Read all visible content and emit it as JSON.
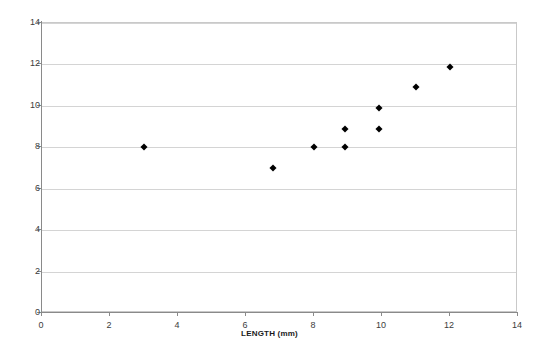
{
  "chart_data": {
    "type": "scatter",
    "title": "",
    "xlabel": "LENGTH (mm)",
    "ylabel": "",
    "xlim": [
      0,
      14
    ],
    "ylim": [
      0,
      14
    ],
    "xticks": [
      0,
      2,
      4,
      6,
      8,
      10,
      12,
      14
    ],
    "yticks": [
      0,
      2,
      4,
      6,
      8,
      10,
      12,
      14
    ],
    "grid": "horizontal",
    "legend": "none",
    "marker": "diamond",
    "marker_color": "#000000",
    "series": [
      {
        "name": "",
        "points": [
          {
            "x": 3.0,
            "y": 8.0
          },
          {
            "x": 6.8,
            "y": 7.0
          },
          {
            "x": 8.0,
            "y": 8.0
          },
          {
            "x": 8.9,
            "y": 8.0
          },
          {
            "x": 8.9,
            "y": 8.9
          },
          {
            "x": 9.9,
            "y": 8.9
          },
          {
            "x": 9.9,
            "y": 9.9
          },
          {
            "x": 11.0,
            "y": 10.9
          },
          {
            "x": 12.0,
            "y": 11.9
          }
        ]
      }
    ]
  },
  "axes": {
    "x_title": "LENGTH (mm)",
    "y_title": "",
    "x_tick_labels": [
      "0",
      "2",
      "4",
      "6",
      "8",
      "10",
      "12",
      "14"
    ],
    "y_tick_labels": [
      "0",
      "2",
      "4",
      "6",
      "8",
      "10",
      "12",
      "14"
    ]
  },
  "colors": {
    "gridline": "#d4d4d4",
    "axis": "#8a8a8a",
    "frame": "#c9c9c9",
    "marker": "#000000",
    "tick_label": "#3c3c3c",
    "background": "#ffffff"
  }
}
